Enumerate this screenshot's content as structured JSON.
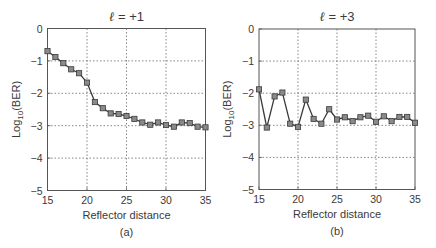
{
  "chart_data": [
    {
      "type": "line",
      "panel_label": "(a)",
      "title_symbol": "ℓ",
      "title_rest": " = +1",
      "title": "ℓ = +1",
      "xlabel": "Reflector distance",
      "ylabel_main": "Log",
      "ylabel_sub": "10",
      "ylabel_tail": "(BER)",
      "ylabel": "Log10(BER)",
      "xlim": [
        15,
        35
      ],
      "ylim": [
        -5,
        0
      ],
      "xticks": [
        15,
        20,
        25,
        30,
        35
      ],
      "yticks": [
        0,
        -1,
        -2,
        -3,
        -4,
        -5
      ],
      "xtick_labels": [
        "15",
        "20",
        "25",
        "30",
        "35"
      ],
      "ytick_labels": [
        "0",
        "−1",
        "−2",
        "−3",
        "−4",
        "−5"
      ],
      "grid": true,
      "marker": "square",
      "series": [
        {
          "name": "l=+1",
          "x": [
            15,
            16,
            17,
            18,
            19,
            20,
            21,
            22,
            23,
            24,
            25,
            26,
            27,
            28,
            29,
            30,
            31,
            32,
            33,
            34,
            35
          ],
          "values": [
            -0.7,
            -0.88,
            -1.07,
            -1.26,
            -1.38,
            -1.67,
            -2.27,
            -2.46,
            -2.62,
            -2.64,
            -2.7,
            -2.79,
            -2.9,
            -2.97,
            -2.9,
            -2.98,
            -3.03,
            -2.9,
            -2.92,
            -3.03,
            -3.05
          ]
        }
      ]
    },
    {
      "type": "line",
      "panel_label": "(b)",
      "title_symbol": "ℓ",
      "title_rest": " = +3",
      "title": "ℓ = +3",
      "xlabel": "Reflector distance",
      "ylabel_main": "Log",
      "ylabel_sub": "10",
      "ylabel_tail": "(BER)",
      "ylabel": "Log10(BER)",
      "xlim": [
        15,
        35
      ],
      "ylim": [
        -5,
        0
      ],
      "xticks": [
        15,
        20,
        25,
        30,
        35
      ],
      "yticks": [
        0,
        -1,
        -2,
        -3,
        -4,
        -5
      ],
      "xtick_labels": [
        "15",
        "20",
        "25",
        "30",
        "35"
      ],
      "ytick_labels": [
        "0",
        "−1",
        "−2",
        "−3",
        "−4",
        "−5"
      ],
      "grid": true,
      "marker": "square",
      "series": [
        {
          "name": "l=+3",
          "x": [
            15,
            16,
            17,
            18,
            19,
            20,
            21,
            22,
            23,
            24,
            25,
            26,
            27,
            28,
            29,
            30,
            31,
            32,
            33,
            34,
            35
          ],
          "values": [
            -1.88,
            -3.07,
            -2.1,
            -1.98,
            -2.95,
            -3.05,
            -2.2,
            -2.8,
            -2.95,
            -2.5,
            -2.82,
            -2.75,
            -2.87,
            -2.75,
            -2.7,
            -2.89,
            -2.72,
            -2.87,
            -2.74,
            -2.74,
            -2.92
          ]
        }
      ]
    }
  ],
  "style": {
    "line_color": "#3a3a3a",
    "marker_fill": "#8a8a8a",
    "marker_edge": "#3a3a3a",
    "grid_color": "#555555",
    "frame_color": "#555555"
  }
}
